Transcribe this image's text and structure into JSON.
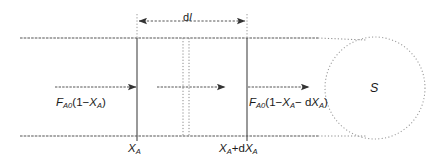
{
  "figure": {
    "kind": "plug-flow-reactor-differential-element-diagram",
    "background_color": "#ffffff",
    "line_color": "#4d4d4d",
    "text_color": "#1a1a1a",
    "width": 429,
    "height": 167
  },
  "dimension": {
    "name": "differential-length",
    "label_prefix": "d",
    "label_symbol": "l",
    "arrow_style": "double-headed-dashed",
    "x_start": 137,
    "x_end": 247,
    "y": 21
  },
  "inlet": {
    "name": "inlet-molar-flow",
    "formula_parts": {
      "F": "F",
      "F_sub": "A0",
      "open": "(1−",
      "X": "X",
      "X_sub": "A",
      "close": ")"
    },
    "arrow": {
      "x_start": 55,
      "x_end": 137,
      "y": 87
    }
  },
  "outlet": {
    "name": "outlet-molar-flow",
    "formula_parts": {
      "F": "F",
      "F_sub": "A0",
      "open": "(1−",
      "X": "X",
      "X_sub": "A",
      "minus": "− d",
      "X2": "X",
      "X2_sub": "A",
      "close": ")"
    },
    "arrow": {
      "x_start": 248,
      "x_end": 310,
      "y": 87
    }
  },
  "middle_arrow": {
    "name": "internal-flow-arrow",
    "x_start": 157,
    "x_end": 226,
    "y": 87
  },
  "positions": {
    "left": {
      "name": "conversion-at-inlet",
      "X": "X",
      "X_sub": "A",
      "x": 137
    },
    "right": {
      "name": "conversion-at-outlet",
      "X": "X",
      "X_sub": "A",
      "plus": "+d",
      "X2": "X",
      "X2_sub": "A",
      "x": 247
    }
  },
  "pipe": {
    "name": "reactor-pipe-walls",
    "x_start": 20,
    "x_solid_end": 318,
    "x_dotted_end": 366,
    "y_top": 38,
    "y_bottom": 136
  },
  "detail_lines": {
    "name": "differential-slice-dotted-pair",
    "x_first": 183,
    "x_second": 189,
    "y_top": 38,
    "y_bottom": 136
  },
  "cross_section": {
    "name": "cross-sectional-area",
    "label": "S",
    "style": "dotted-ellipse",
    "cx": 375,
    "cy": 88,
    "rx": 50,
    "ry": 51
  }
}
